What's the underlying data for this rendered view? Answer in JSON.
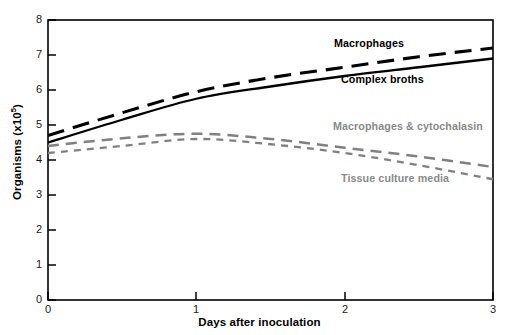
{
  "chart_data": {
    "type": "line",
    "title": "",
    "xlabel": "Days after inoculation",
    "ylabel": "Organisms (x10",
    "ylabel_exponent": "5",
    "ylabel_suffix": ")",
    "xlim": [
      0,
      3
    ],
    "ylim": [
      0,
      8
    ],
    "xticks": [
      "0",
      "1",
      "2",
      "3"
    ],
    "yticks": [
      "0",
      "1",
      "2",
      "3",
      "4",
      "5",
      "6",
      "7",
      "8"
    ],
    "grid": false,
    "legend_position": "inline-annotations",
    "x": [
      0,
      0.5,
      1,
      1.5,
      2,
      2.5,
      3
    ],
    "series": [
      {
        "name": "Macrophages",
        "label": "Macrophages",
        "style": "long-dashed",
        "color": "#000000",
        "values": [
          4.7,
          5.35,
          5.95,
          6.35,
          6.65,
          6.95,
          7.2
        ]
      },
      {
        "name": "Complex broths",
        "label": "Complex broths",
        "style": "solid",
        "color": "#000000",
        "values": [
          4.5,
          5.15,
          5.75,
          6.1,
          6.4,
          6.65,
          6.9
        ]
      },
      {
        "name": "Macrophages & cytochalasin",
        "label": "Macrophages & cytochalasin",
        "style": "medium-dashed",
        "color": "#808080",
        "values": [
          4.4,
          4.62,
          4.75,
          4.6,
          4.35,
          4.1,
          3.8
        ]
      },
      {
        "name": "Tissue culture media",
        "label": "Tissue culture media",
        "style": "short-dashed",
        "color": "#808080",
        "values": [
          4.2,
          4.4,
          4.6,
          4.45,
          4.2,
          3.85,
          3.45
        ]
      }
    ],
    "annotations": [
      {
        "text": "Macrophages",
        "color": "#000000"
      },
      {
        "text": "Complex broths",
        "color": "#000000"
      },
      {
        "text": "Macrophages & cytochalasin",
        "color": "#808080"
      },
      {
        "text": "Tissue culture media",
        "color": "#808080"
      }
    ]
  }
}
